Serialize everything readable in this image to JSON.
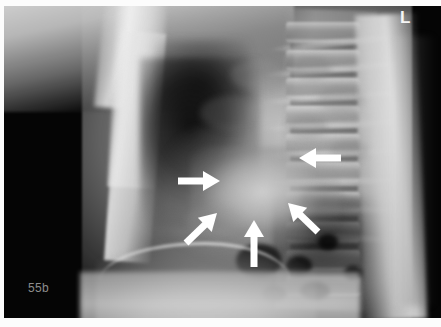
{
  "image": {
    "kind": "lateral-chest-radiograph",
    "width": 441,
    "height": 327,
    "background_color": "#050505",
    "frame_color": "#fcfcfc"
  },
  "markers": {
    "figure_label": "55b",
    "figure_label_color": "#8d8d8d",
    "laterality": "L",
    "laterality_color": "#f6f6f6"
  },
  "annotations": {
    "arrow_color": "#ffffff",
    "count": 5,
    "arrows": [
      {
        "id": "arrow-hilar-anterior",
        "direction": "right",
        "tail": [
          178,
          181
        ],
        "head": [
          220,
          181
        ],
        "target": "anterior hilar density"
      },
      {
        "id": "arrow-posterior-upper",
        "direction": "left",
        "tail": [
          341,
          158
        ],
        "head": [
          299,
          158
        ],
        "target": "posterior mediastinal border"
      },
      {
        "id": "arrow-infrahilar-anterior",
        "direction": "up-right",
        "tail": [
          186,
          243
        ],
        "head": [
          217,
          213
        ],
        "target": "inferior anterior hilar margin"
      },
      {
        "id": "arrow-infrahilar-posterior",
        "direction": "up-left",
        "tail": [
          318,
          232
        ],
        "head": [
          288,
          203
        ],
        "target": "inferior posterior hilar margin"
      },
      {
        "id": "arrow-retrocardiac",
        "direction": "up",
        "tail": [
          254,
          267
        ],
        "head": [
          254,
          220
        ],
        "target": "retrocardiac density"
      }
    ]
  },
  "anatomy": {
    "structures": [
      "shoulder-soft-tissue",
      "humerus-shaft",
      "sternum",
      "retrosternal-lung",
      "hilar-density",
      "cardiac-shadow",
      "thoracic-spine",
      "posterior-ribs",
      "posterior-chest-wall",
      "diaphragm",
      "abdomen"
    ],
    "vertebrae": [
      {
        "top": 22
      },
      {
        "top": 50
      },
      {
        "top": 78
      },
      {
        "top": 106
      },
      {
        "top": 134
      },
      {
        "top": 162
      },
      {
        "top": 192
      },
      {
        "top": 222
      },
      {
        "top": 250
      },
      {
        "top": 276
      }
    ],
    "discs": [
      {
        "top": 44
      },
      {
        "top": 72
      },
      {
        "top": 100
      },
      {
        "top": 128
      },
      {
        "top": 156
      },
      {
        "top": 186
      },
      {
        "top": 216
      },
      {
        "top": 244
      },
      {
        "top": 272
      }
    ],
    "ribs": [
      {
        "left": 268,
        "top": 40,
        "width": 130,
        "rotate": -6
      },
      {
        "left": 264,
        "top": 66,
        "width": 136,
        "rotate": -5
      },
      {
        "left": 262,
        "top": 94,
        "width": 140,
        "rotate": -4
      },
      {
        "left": 260,
        "top": 122,
        "width": 142,
        "rotate": -3
      },
      {
        "left": 262,
        "top": 150,
        "width": 138,
        "rotate": -2
      },
      {
        "left": 268,
        "top": 178,
        "width": 130,
        "rotate": -1
      },
      {
        "left": 276,
        "top": 206,
        "width": 120,
        "rotate": 1
      },
      {
        "left": 284,
        "top": 234,
        "width": 108,
        "rotate": 3
      }
    ],
    "gas_pockets": [
      {
        "left": 236,
        "top": 244,
        "width": 46,
        "height": 34
      },
      {
        "left": 286,
        "top": 256,
        "width": 26,
        "height": 20
      },
      {
        "left": 318,
        "top": 234,
        "width": 20,
        "height": 16
      },
      {
        "left": 300,
        "top": 282,
        "width": 30,
        "height": 18
      },
      {
        "left": 344,
        "top": 266,
        "width": 18,
        "height": 14
      },
      {
        "left": 262,
        "top": 286,
        "width": 24,
        "height": 16
      }
    ],
    "mottles": [
      {
        "left": 292,
        "top": 56,
        "width": 40,
        "height": 24,
        "color": "rgba(120,120,120,0.30)"
      },
      {
        "left": 318,
        "top": 86,
        "width": 46,
        "height": 26,
        "color": "rgba(128,128,128,0.26)"
      },
      {
        "left": 286,
        "top": 116,
        "width": 42,
        "height": 22,
        "color": "rgba(110,110,110,0.28)"
      },
      {
        "left": 330,
        "top": 140,
        "width": 38,
        "height": 22,
        "color": "rgba(118,118,118,0.24)"
      },
      {
        "left": 200,
        "top": 96,
        "width": 60,
        "height": 34,
        "color": "rgba(150,150,150,0.20)"
      },
      {
        "left": 230,
        "top": 60,
        "width": 54,
        "height": 30,
        "color": "rgba(160,160,160,0.22)"
      },
      {
        "left": 186,
        "top": 206,
        "width": 56,
        "height": 30,
        "color": "rgba(150,150,150,0.22)"
      },
      {
        "left": 300,
        "top": 186,
        "width": 48,
        "height": 26,
        "color": "rgba(120,120,120,0.22)"
      }
    ]
  }
}
